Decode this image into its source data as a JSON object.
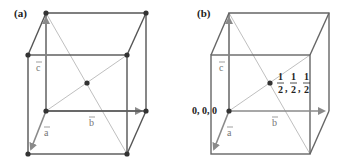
{
  "panels": [
    {
      "label": "(a)",
      "vectors": {
        "a": "a",
        "b": "b",
        "c": "c"
      },
      "description": "body-centered unit cell with corner and center atoms"
    },
    {
      "label": "(b)",
      "vectors": {
        "a": "a",
        "b": "b",
        "c": "c"
      },
      "origin_label": "0, 0, 0",
      "center_label": {
        "num": "1",
        "den": "2",
        "sep": ","
      },
      "description": "unit cell with origin and center coordinates"
    }
  ],
  "colors": {
    "edge": "#555555",
    "vector": "#8a8a8a",
    "diagonal": "#b8b8b8",
    "atom": "#333333"
  }
}
